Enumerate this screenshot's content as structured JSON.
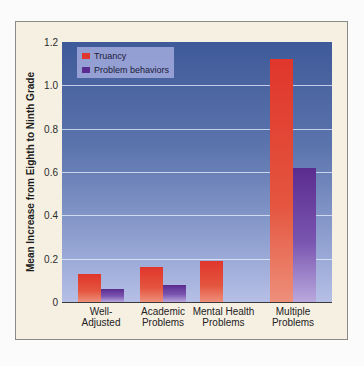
{
  "chart_data": {
    "type": "bar",
    "title": "",
    "xlabel": "",
    "ylabel": "Mean Increase from Eighth to Ninth Grade",
    "ylim": [
      0,
      1.2
    ],
    "yticks": [
      "0",
      "0.2",
      "0.4",
      "0.6",
      "0.8",
      "1.0",
      "1.2"
    ],
    "grid": true,
    "legend_position": "upper-left",
    "categories": [
      "Well-Adjusted",
      "Academic Problems",
      "Mental Health Problems",
      "Multiple Problems"
    ],
    "category_labels": [
      [
        "Well-",
        "Adjusted"
      ],
      [
        "Academic",
        "Problems"
      ],
      [
        "Mental Health",
        "Problems"
      ],
      [
        "Multiple",
        "Problems"
      ]
    ],
    "series": [
      {
        "name": "Truancy",
        "color": "#e0362b",
        "values": [
          0.13,
          0.16,
          0.19,
          1.12
        ]
      },
      {
        "name": "Problem behaviors",
        "color": "#5a2c8f",
        "values": [
          0.06,
          0.08,
          0.0,
          0.62
        ]
      }
    ]
  }
}
